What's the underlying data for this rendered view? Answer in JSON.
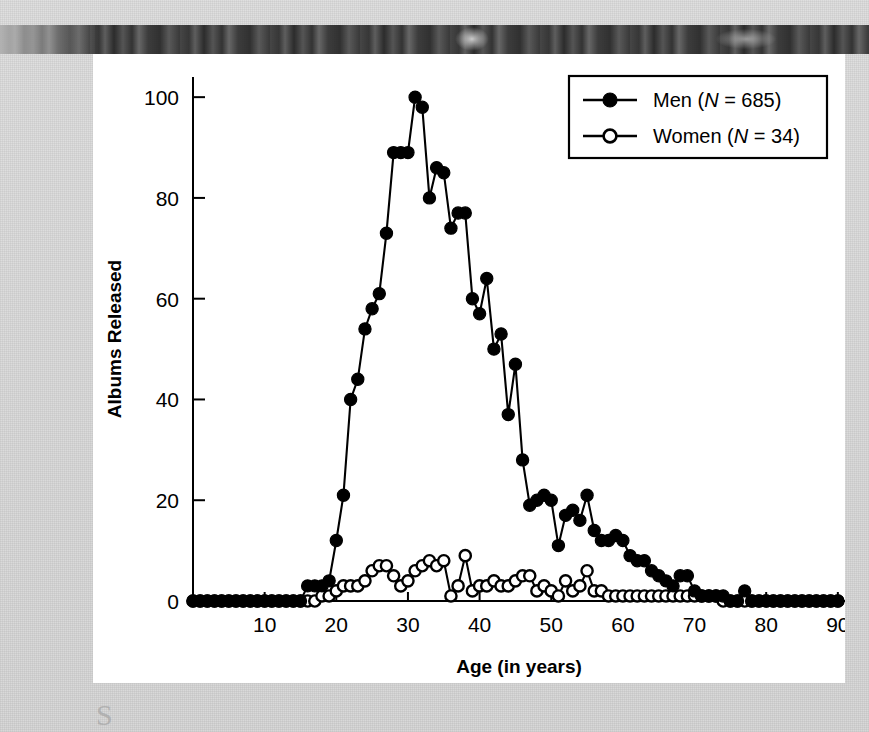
{
  "figure": {
    "panel_background": "#ffffff",
    "page_background": "#d9d9d9",
    "ink_color": "#000000",
    "smudge_glyph": "S"
  },
  "chart_data": {
    "type": "line",
    "title": "",
    "xlabel": "Age (in years)",
    "ylabel": "Albums Released",
    "xlim": [
      0,
      91
    ],
    "ylim": [
      0,
      104
    ],
    "xticks": [
      10,
      20,
      30,
      40,
      50,
      60,
      70,
      80,
      90
    ],
    "yticks": [
      0,
      20,
      40,
      60,
      80,
      100
    ],
    "grid": false,
    "legend_position": "top-right",
    "legend": [
      {
        "label_main": "Men",
        "label_stat": "(N = 685)",
        "marker": "filled-circle"
      },
      {
        "label_main": "Women",
        "label_stat": "(N = 34)",
        "marker": "open-circle"
      }
    ],
    "x": [
      0,
      1,
      2,
      3,
      4,
      5,
      6,
      7,
      8,
      9,
      10,
      11,
      12,
      13,
      14,
      15,
      16,
      17,
      18,
      19,
      20,
      21,
      22,
      23,
      24,
      25,
      26,
      27,
      28,
      29,
      30,
      31,
      32,
      33,
      34,
      35,
      36,
      37,
      38,
      39,
      40,
      41,
      42,
      43,
      44,
      45,
      46,
      47,
      48,
      49,
      50,
      51,
      52,
      53,
      54,
      55,
      56,
      57,
      58,
      59,
      60,
      61,
      62,
      63,
      64,
      65,
      66,
      67,
      68,
      69,
      70,
      71,
      72,
      73,
      74,
      75,
      76,
      77,
      78,
      79,
      80,
      81,
      82,
      83,
      84,
      85,
      86,
      87,
      88,
      89,
      90
    ],
    "series": [
      {
        "name": "Men",
        "n": 685,
        "marker": "filled-circle",
        "values": [
          0,
          0,
          0,
          0,
          0,
          0,
          0,
          0,
          0,
          0,
          0,
          0,
          0,
          0,
          0,
          0,
          3,
          3,
          3,
          4,
          12,
          21,
          40,
          44,
          54,
          58,
          61,
          73,
          89,
          89,
          89,
          100,
          98,
          80,
          86,
          85,
          74,
          77,
          77,
          60,
          57,
          64,
          50,
          53,
          37,
          47,
          28,
          19,
          20,
          21,
          20,
          11,
          17,
          18,
          16,
          21,
          14,
          12,
          12,
          13,
          12,
          9,
          8,
          8,
          6,
          5,
          4,
          3,
          5,
          5,
          2,
          1,
          1,
          1,
          1,
          0,
          0,
          2,
          0,
          0,
          0,
          0,
          0,
          0,
          0,
          0,
          0,
          0,
          0,
          0,
          0
        ]
      },
      {
        "name": "Women",
        "n": 34,
        "marker": "open-circle",
        "values": [
          0,
          0,
          0,
          0,
          0,
          0,
          0,
          0,
          0,
          0,
          0,
          0,
          0,
          0,
          0,
          0,
          0,
          0,
          1,
          1,
          2,
          3,
          3,
          3,
          4,
          6,
          7,
          7,
          5,
          3,
          4,
          6,
          7,
          8,
          7,
          8,
          1,
          3,
          9,
          2,
          3,
          3,
          4,
          3,
          3,
          4,
          5,
          5,
          2,
          3,
          2,
          1,
          4,
          2,
          3,
          6,
          2,
          2,
          1,
          1,
          1,
          1,
          1,
          1,
          1,
          1,
          1,
          1,
          1,
          1,
          1,
          1,
          1,
          1,
          0,
          0,
          0,
          0,
          0,
          0,
          0,
          0,
          0,
          0,
          0,
          0,
          0,
          0,
          0,
          0,
          0
        ]
      }
    ]
  }
}
